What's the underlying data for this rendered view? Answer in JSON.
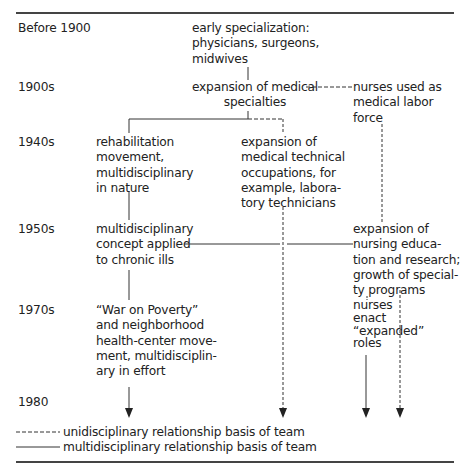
{
  "periods": [
    {
      "label": "Before 1900"
    },
    {
      "label": "1900s"
    },
    {
      "label": "1940s"
    },
    {
      "label": "1950s"
    },
    {
      "label": "1970s"
    },
    {
      "label": "1980"
    }
  ],
  "nodes": {
    "early_specialization": "early specialization:\nphysicians, surgeons,\nmidwives",
    "expansion_medical_specialties": "expansion of medical\nspecialties",
    "nurses_labor_force": "nurses used as\nmedical labor\nforce",
    "rehabilitation_movement": "rehabilitation\nmovement,\nmultidisciplinary\nin nature",
    "medical_technical": "expansion of\nmedical technical\noccupations, for\nexample, labora-\ntory technicians",
    "multidisciplinary_chronic": "multidisciplinary\nconcept applied\nto chronic ills",
    "nursing_education": "expansion of\nnursing educa-\ntion and research;\ngrowth of special-\nty programs",
    "war_on_poverty": "“War on Poverty”\nand neighborhood\nhealth-center move-\nment, multidisciplin-\nary in effort",
    "nurses_expanded_roles": "nurses\nenact\n“expanded”\nroles"
  },
  "legend": {
    "dashed": "unidisciplinary relationship basis of team",
    "solid": "multidisciplinary relationship basis of team"
  },
  "colors": {
    "line": "#333333",
    "text": "#222222"
  }
}
